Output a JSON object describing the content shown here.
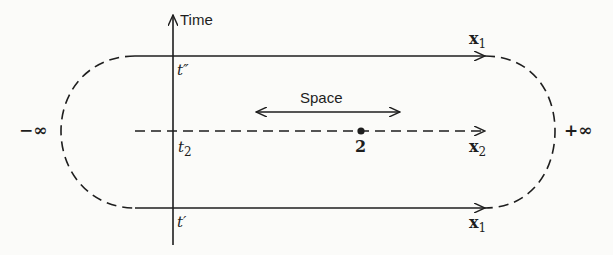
{
  "diagram": {
    "axis_label": "Time",
    "space_label": "Space",
    "times": {
      "t_double_prime": "t″",
      "t_2": "t",
      "t_2_sub": "2",
      "t_prime": "t′"
    },
    "paths": {
      "top": {
        "label": "x",
        "sub": "1",
        "style": "solid"
      },
      "middle": {
        "label": "x",
        "sub": "2",
        "style": "dashed"
      },
      "bottom": {
        "label": "x",
        "sub": "1",
        "style": "solid"
      }
    },
    "point_label": "2",
    "infinity_left": "−∞",
    "infinity_right": "+∞",
    "colors": {
      "ink": "#1e1e1e",
      "paper": "#fbfbf9"
    }
  }
}
